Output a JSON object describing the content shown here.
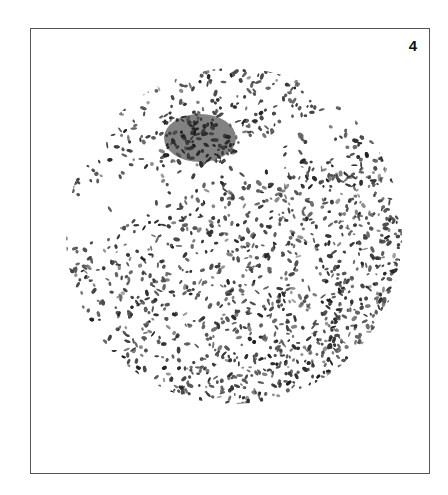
{
  "figure": {
    "panel_number": "4",
    "colors": {
      "frame_border": "#555555",
      "ink": "#2a2a2a",
      "background": "#ffffff"
    },
    "circle": {
      "cx": 234,
      "cy": 236,
      "r": 170
    },
    "dark_patch": {
      "cx": 200,
      "cy": 138,
      "rx": 38,
      "ry": 26
    }
  }
}
